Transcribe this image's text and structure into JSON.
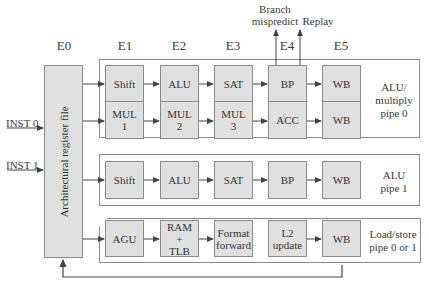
{
  "stages": [
    "E0",
    "E1",
    "E2",
    "E3",
    "E4",
    "E5"
  ],
  "register_file": {
    "label": "Architectural register file"
  },
  "inputs": [
    {
      "label": "INST 0"
    },
    {
      "label": "INST 1"
    }
  ],
  "outputs": {
    "branch": "Branch\nmispredict",
    "branch_line1": "Branch",
    "branch_line2": "mispredict",
    "replay": "Replay"
  },
  "pipes": [
    {
      "name": "ALU/multiply pipe 0",
      "label_lines": [
        "ALU/",
        "multiply",
        "pipe 0"
      ],
      "rows": [
        [
          "Shift",
          "ALU",
          "SAT",
          "BP",
          "WB"
        ],
        [
          "MUL 1",
          "MUL 2",
          "MUL 3",
          "ACC",
          "WB"
        ]
      ]
    },
    {
      "name": "ALU pipe 1",
      "label_lines": [
        "ALU",
        "pipe 1"
      ],
      "rows": [
        [
          "Shift",
          "ALU",
          "SAT",
          "BP",
          "WB"
        ]
      ]
    },
    {
      "name": "Load/store pipe 0 or 1",
      "label_lines": [
        "Load/store",
        "pipe 0 or 1"
      ],
      "rows": [
        [
          "AGU",
          "RAM + TLB",
          "Format forward",
          "L2 update",
          "WB"
        ]
      ]
    }
  ],
  "box_text": {
    "p0r1": [
      "MUL",
      "1",
      "MUL",
      "2",
      "MUL",
      "3"
    ],
    "ram_tlb": [
      "RAM",
      "+",
      "TLB"
    ],
    "format_forward": [
      "Format",
      "forward"
    ],
    "l2_update": [
      "L2",
      "update"
    ]
  },
  "colors": {
    "box_fill": "#e0e0e0",
    "box_border": "#8a8a8a",
    "line": "#444444"
  }
}
